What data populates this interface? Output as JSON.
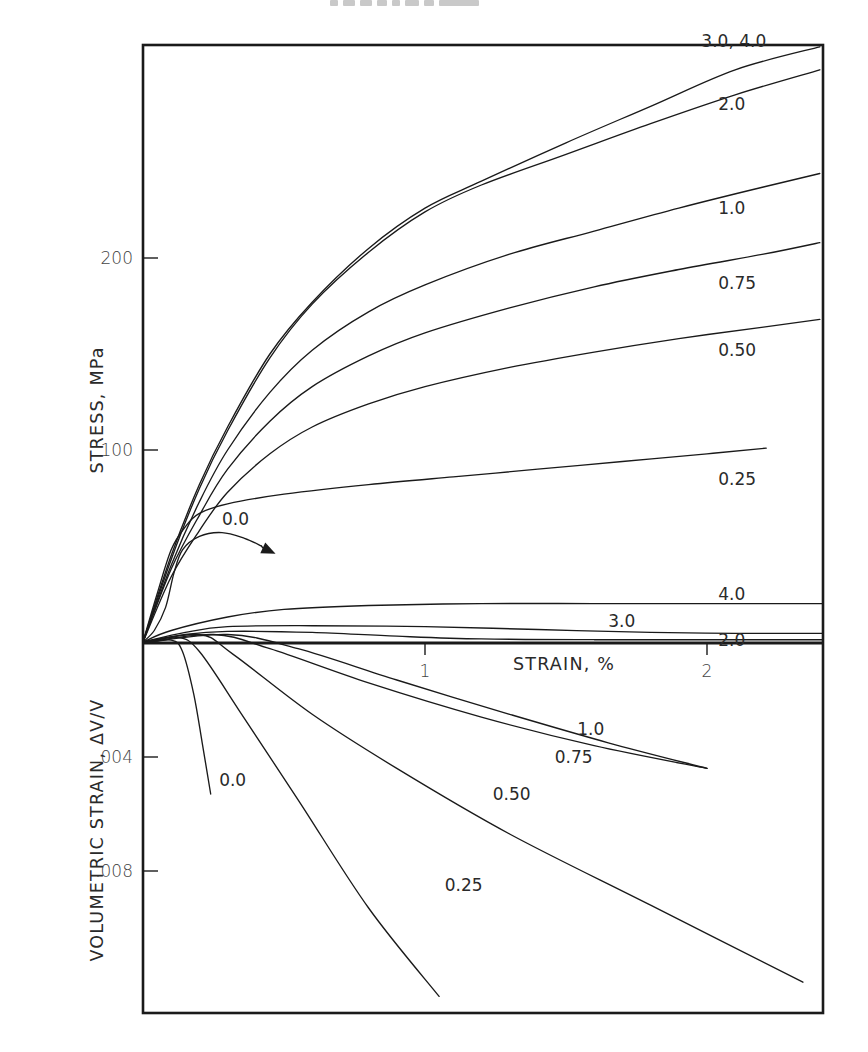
{
  "header": {
    "smudge_text": "■■■ ■■ ■■■"
  },
  "chart_data": {
    "type": "line",
    "title": "",
    "layout": {
      "frame": {
        "left": 143,
        "top": 45,
        "right": 823,
        "bottom": 1013
      },
      "x_origin_px": 143,
      "x_px_per_unit": 282,
      "stress_origin_px": 642,
      "stress_px_per_unit": 1.92,
      "vol_origin_px": 643,
      "vol_px_per_unit": 28500,
      "grid": false,
      "legend": "inline curve labels (confining pressure)"
    },
    "xlabel": "STRAIN, %",
    "x_ticks": [
      {
        "value": 1,
        "label": "1"
      },
      {
        "value": 2,
        "label": "2"
      }
    ],
    "xlim": [
      0,
      2.41
    ],
    "upper_panel": {
      "ylabel": "STRESS, MPa",
      "ylim": [
        0,
        310
      ],
      "y_ticks": [
        {
          "value": 100,
          "label": "100"
        },
        {
          "value": 200,
          "label": "200"
        }
      ],
      "series": [
        {
          "name": "3.0, 4.0",
          "points": [
            [
              0,
              0
            ],
            [
              0.1,
              45
            ],
            [
              0.2,
              82
            ],
            [
              0.3,
              112
            ],
            [
              0.45,
              150
            ],
            [
              0.6,
              177
            ],
            [
              0.8,
              205
            ],
            [
              1.0,
              226
            ],
            [
              1.2,
              240
            ],
            [
              1.5,
              260
            ],
            [
              1.8,
              279
            ],
            [
              2.1,
              298
            ],
            [
              2.4,
              310
            ]
          ]
        },
        {
          "name": "2.0",
          "points": [
            [
              0,
              0
            ],
            [
              0.1,
              43
            ],
            [
              0.2,
              80
            ],
            [
              0.3,
              110
            ],
            [
              0.45,
              148
            ],
            [
              0.6,
              176
            ],
            [
              0.8,
              203
            ],
            [
              1.0,
              224
            ],
            [
              1.2,
              238
            ],
            [
              1.5,
              254
            ],
            [
              1.8,
              270
            ],
            [
              2.1,
              285
            ],
            [
              2.4,
              298
            ]
          ]
        },
        {
          "name": "1.0",
          "points": [
            [
              0,
              0
            ],
            [
              0.1,
              40
            ],
            [
              0.2,
              73
            ],
            [
              0.3,
              100
            ],
            [
              0.45,
              130
            ],
            [
              0.6,
              152
            ],
            [
              0.8,
              172
            ],
            [
              1.0,
              186
            ],
            [
              1.3,
              202
            ],
            [
              1.6,
              214
            ],
            [
              1.9,
              226
            ],
            [
              2.2,
              237
            ],
            [
              2.4,
              244
            ]
          ]
        },
        {
          "name": "0.75",
          "points": [
            [
              0,
              0
            ],
            [
              0.1,
              38
            ],
            [
              0.2,
              66
            ],
            [
              0.3,
              90
            ],
            [
              0.45,
              115
            ],
            [
              0.6,
              133
            ],
            [
              0.8,
              149
            ],
            [
              1.0,
              161
            ],
            [
              1.3,
              174
            ],
            [
              1.6,
              185
            ],
            [
              1.9,
              194
            ],
            [
              2.2,
              202
            ],
            [
              2.4,
              208
            ]
          ]
        },
        {
          "name": "0.50",
          "points": [
            [
              0,
              0
            ],
            [
              0.1,
              34
            ],
            [
              0.2,
              58
            ],
            [
              0.3,
              78
            ],
            [
              0.45,
              98
            ],
            [
              0.6,
              112
            ],
            [
              0.8,
              124
            ],
            [
              1.0,
              133
            ],
            [
              1.3,
              143
            ],
            [
              1.6,
              151
            ],
            [
              1.9,
              158
            ],
            [
              2.2,
              164
            ],
            [
              2.4,
              168
            ]
          ]
        },
        {
          "name": "0.25",
          "points": [
            [
              0,
              0
            ],
            [
              0.05,
              25
            ],
            [
              0.1,
              48
            ],
            [
              0.15,
              60
            ],
            [
              0.2,
              67
            ],
            [
              0.3,
              72
            ],
            [
              0.5,
              77
            ],
            [
              0.8,
              82
            ],
            [
              1.1,
              86
            ],
            [
              1.4,
              90
            ],
            [
              1.7,
              94
            ],
            [
              2.0,
              98
            ],
            [
              2.21,
              101
            ]
          ]
        },
        {
          "name": "0.0",
          "points": [
            [
              0,
              0
            ],
            [
              0.04,
              6
            ],
            [
              0.08,
              18
            ],
            [
              0.11,
              36
            ],
            [
              0.14,
              48
            ],
            [
              0.2,
              55
            ],
            [
              0.28,
              57
            ],
            [
              0.36,
              54
            ],
            [
              0.42,
              50
            ]
          ]
        },
        {
          "name": "4.0",
          "points": [
            [
              0,
              0
            ],
            [
              0.1,
              6
            ],
            [
              0.3,
              13
            ],
            [
              0.5,
              17
            ],
            [
              0.8,
              19
            ],
            [
              1.2,
              20
            ],
            [
              1.6,
              20
            ],
            [
              2.0,
              20
            ],
            [
              2.41,
              20
            ]
          ]
        },
        {
          "name": "3.0",
          "points": [
            [
              0,
              0
            ],
            [
              0.15,
              5
            ],
            [
              0.3,
              8
            ],
            [
              0.6,
              8.5
            ],
            [
              1.0,
              8
            ],
            [
              1.4,
              6.5
            ],
            [
              1.8,
              5
            ],
            [
              2.1,
              4.5
            ],
            [
              2.41,
              4.5
            ]
          ]
        },
        {
          "name": "2.0",
          "points": [
            [
              0,
              0
            ],
            [
              0.15,
              4
            ],
            [
              0.3,
              5.5
            ],
            [
              0.6,
              5
            ],
            [
              0.9,
              3
            ],
            [
              1.2,
              1.6
            ],
            [
              1.6,
              1.2
            ],
            [
              2.0,
              1.2
            ],
            [
              2.41,
              1.2
            ]
          ]
        }
      ],
      "annotations": [
        {
          "text": "3.0, 4.0",
          "x": 1.98,
          "y": 313
        },
        {
          "text": "2.0",
          "x": 2.04,
          "y": 280
        },
        {
          "text": "1.0",
          "x": 2.04,
          "y": 226
        },
        {
          "text": "0.75",
          "x": 2.04,
          "y": 187
        },
        {
          "text": "0.50",
          "x": 2.04,
          "y": 152
        },
        {
          "text": "0.25",
          "x": 2.04,
          "y": 85
        },
        {
          "text": "0.0",
          "x": 0.28,
          "y": 64
        },
        {
          "text": "4.0",
          "x": 2.04,
          "y": 25
        },
        {
          "text": "3.0",
          "x": 1.65,
          "y": 11
        },
        {
          "text": "2.0",
          "x": 2.04,
          "y": 1
        }
      ],
      "arrow": {
        "from": [
          0.38,
          52
        ],
        "to": [
          0.47,
          46
        ],
        "label_ref": "0.0"
      }
    },
    "lower_panel": {
      "ylabel": "VOLUMETRIC STRAIN, ΔV/V",
      "ylim": [
        0.0129,
        0
      ],
      "y_ticks": [
        {
          "value": 0.004,
          "label": ".004"
        },
        {
          "value": 0.008,
          "label": ".008"
        }
      ],
      "series": [
        {
          "name": "0.0",
          "points": [
            [
              0,
              0
            ],
            [
              0.1,
              -0.0001
            ],
            [
              0.14,
              0.0003
            ],
            [
              0.18,
              0.0018
            ],
            [
              0.21,
              0.0035
            ],
            [
              0.24,
              0.0053
            ]
          ]
        },
        {
          "name": "0.25",
          "points": [
            [
              0,
              0
            ],
            [
              0.12,
              -0.0002
            ],
            [
              0.2,
              0.0003
            ],
            [
              0.35,
              0.0025
            ],
            [
              0.55,
              0.0055
            ],
            [
              0.8,
              0.0093
            ],
            [
              1.05,
              0.0124
            ]
          ]
        },
        {
          "name": "0.50",
          "points": [
            [
              0,
              0
            ],
            [
              0.2,
              -0.0003
            ],
            [
              0.32,
              0.0004
            ],
            [
              0.6,
              0.0025
            ],
            [
              0.9,
              0.0044
            ],
            [
              1.3,
              0.0067
            ],
            [
              1.8,
              0.0092
            ],
            [
              2.34,
              0.0119
            ]
          ]
        },
        {
          "name": "0.75",
          "points": [
            [
              0,
              0
            ],
            [
              0.25,
              -0.0003
            ],
            [
              0.45,
              0.0002
            ],
            [
              0.8,
              0.0014
            ],
            [
              1.2,
              0.0026
            ],
            [
              1.6,
              0.0036
            ],
            [
              2.0,
              0.0044
            ]
          ]
        },
        {
          "name": "1.0",
          "points": [
            [
              0,
              0
            ],
            [
              0.3,
              -0.0003
            ],
            [
              0.55,
              0.0002
            ],
            [
              0.9,
              0.0013
            ],
            [
              1.3,
              0.0025
            ],
            [
              1.65,
              0.0035
            ],
            [
              2.0,
              0.0044
            ]
          ]
        }
      ],
      "annotations": [
        {
          "text": "0.0",
          "x": 0.27,
          "y": 0.0048
        },
        {
          "text": "0.25",
          "x": 1.07,
          "y": 0.0085
        },
        {
          "text": "0.50",
          "x": 1.24,
          "y": 0.0053
        },
        {
          "text": "0.75",
          "x": 1.46,
          "y": 0.004
        },
        {
          "text": "1.0",
          "x": 1.54,
          "y": 0.003
        }
      ]
    }
  }
}
